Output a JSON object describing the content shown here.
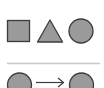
{
  "diagram": {
    "type": "shape-sequence-puzzle",
    "colors": {
      "background": "#ffffff",
      "shape_fill": "#9a9a9a",
      "shape_stroke": "#3c3c3c",
      "divider": "#c8c8c8",
      "arrow": "#3c3c3c"
    },
    "top_row": {
      "shapes": [
        {
          "kind": "square",
          "label": "square"
        },
        {
          "kind": "triangle",
          "label": "triangle"
        },
        {
          "kind": "circle",
          "label": "circle"
        }
      ]
    },
    "bottom_row": {
      "items": [
        {
          "kind": "circle",
          "label": "circle"
        },
        {
          "kind": "arrow",
          "label": "right arrow"
        },
        {
          "kind": "circle",
          "label": "circle"
        }
      ]
    }
  }
}
